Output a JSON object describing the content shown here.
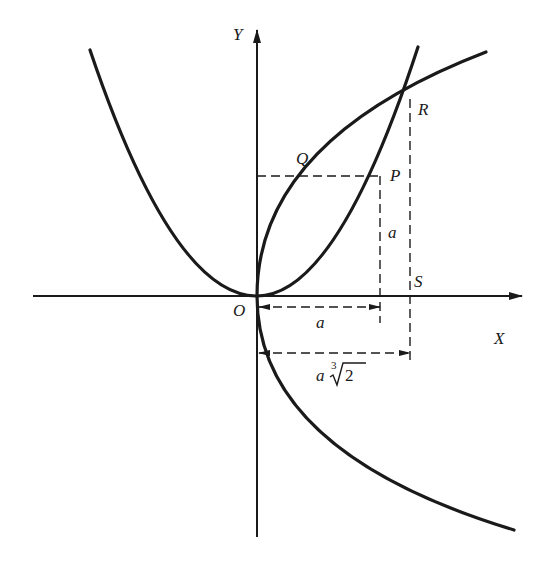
{
  "diagram": {
    "axes": {
      "x_label": "X",
      "y_label": "Y",
      "origin_label": "O"
    },
    "points": {
      "P": "P",
      "Q": "Q",
      "R": "R",
      "S": "S"
    },
    "dimensions": {
      "horizontal_a": "a",
      "vertical_a": "a",
      "long_dim_coeff": "a",
      "long_dim_root_index": "3",
      "long_dim_radicand": "2"
    },
    "curves": [
      {
        "name": "parabola-up",
        "equation": "y = x^2 / a"
      },
      {
        "name": "parabola-right",
        "equation": "x = y^2 / (2a)"
      }
    ],
    "colors": {
      "stroke": "#1a1a1a",
      "background": "#ffffff"
    }
  }
}
